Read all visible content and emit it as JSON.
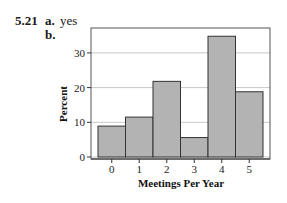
{
  "problem": {
    "number": "5.21",
    "part_a": {
      "label": "a.",
      "answer": "yes"
    },
    "part_b": {
      "label": "b."
    }
  },
  "colors": {
    "bar_fill": "#b3b3b3",
    "bar_stroke": "#333333",
    "grid": "#c8c8c8",
    "frame": "#555555"
  },
  "chart_data": {
    "type": "bar",
    "title": "",
    "xlabel": "Meetings Per Year",
    "ylabel": "Percent",
    "categories": [
      "0",
      "1",
      "2",
      "3",
      "4",
      "5"
    ],
    "values": [
      8.9,
      11.5,
      21.8,
      5.6,
      34.8,
      18.8
    ],
    "ylim": [
      0,
      37
    ],
    "yticks": [
      0,
      10,
      20,
      30
    ],
    "grid": true,
    "legend": null,
    "bar_style": "histogram (touching bars)"
  }
}
